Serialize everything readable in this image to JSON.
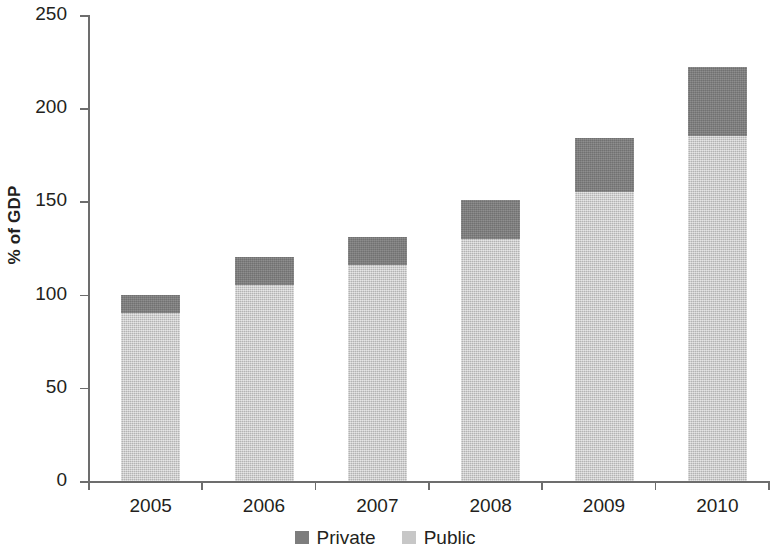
{
  "chart_data": {
    "type": "bar",
    "subtype": "stacked-bar",
    "title": "",
    "subtitle": "",
    "xlabel": "",
    "ylabel": "% of GDP",
    "categories": [
      "2005",
      "2006",
      "2007",
      "2008",
      "2009",
      "2010"
    ],
    "series": [
      {
        "name": "Public",
        "color": "#c7c7c7",
        "values": [
          90,
          105,
          116,
          130,
          155,
          185
        ]
      },
      {
        "name": "Private",
        "color": "#7d7d7d",
        "values": [
          10,
          15,
          15,
          21,
          29,
          37
        ]
      }
    ],
    "totals": [
      100,
      120,
      131,
      151,
      184,
      222
    ],
    "ylim": [
      0,
      250
    ],
    "yticks": [
      0,
      50,
      100,
      150,
      200,
      250
    ],
    "ytick_labels": [
      "0",
      "50",
      "100",
      "150",
      "200",
      "250"
    ],
    "grid": false,
    "legend_position": "bottom",
    "legend_entries": [
      "Private",
      "Public"
    ]
  },
  "axes": {
    "y_title": "% of GDP",
    "y_ticks": [
      {
        "value": 250,
        "label": "250"
      },
      {
        "value": 200,
        "label": "200"
      },
      {
        "value": 150,
        "label": "150"
      },
      {
        "value": 100,
        "label": "100"
      },
      {
        "value": 50,
        "label": "50"
      },
      {
        "value": 0,
        "label": "0"
      }
    ],
    "x_ticks": [
      {
        "label": "2005"
      },
      {
        "label": "2006"
      },
      {
        "label": "2007"
      },
      {
        "label": "2008"
      },
      {
        "label": "2009"
      },
      {
        "label": "2010"
      }
    ]
  },
  "legend": {
    "items": [
      {
        "label": "Private",
        "color": "#7d7d7d"
      },
      {
        "label": "Public",
        "color": "#c7c7c7"
      }
    ]
  },
  "colors": {
    "private": "#7d7d7d",
    "public": "#c7c7c7",
    "axis": "#6d6d6d",
    "text": "#231f20",
    "background": "#ffffff"
  }
}
